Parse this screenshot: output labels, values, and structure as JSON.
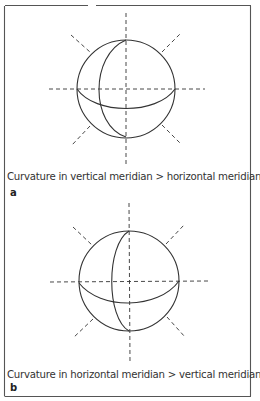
{
  "figure": {
    "panels": [
      {
        "label": "a",
        "caption": "Curvature in vertical meridian > horizontal meridian"
      },
      {
        "label": "b",
        "caption": "Curvature in horizontal meridian > vertical meridian"
      }
    ]
  },
  "colors": {
    "stroke": "#333333",
    "border": "#555555",
    "background": "#ffffff"
  }
}
